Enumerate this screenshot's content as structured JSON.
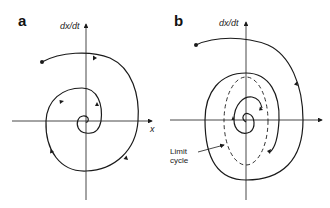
{
  "panels": [
    {
      "letter": "a",
      "y_axis_label": "dx/dt",
      "x_axis_label": "x",
      "description": "Stable spiral: trajectory spirals inward to the fixed point at the origin"
    },
    {
      "letter": "b",
      "y_axis_label": "dx/dt",
      "annotation_line1": "Limit",
      "annotation_line2": "cycle",
      "description": "Trajectories from outside and inside converge onto a dashed closed orbit (limit cycle)"
    }
  ],
  "colors": {
    "stroke": "#1a1a1a",
    "background": "#ffffff"
  }
}
